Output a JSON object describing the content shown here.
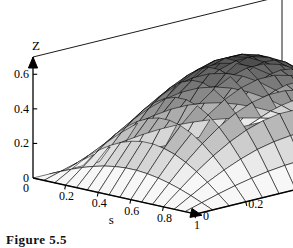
{
  "figure": {
    "caption": "Figure 5.5",
    "kind": "3d-surface-plot",
    "background_color": "#ffffff",
    "line_color": "#000000"
  },
  "axes": {
    "z": {
      "title": "Z",
      "ticks": [
        "0.6",
        "0.4",
        "0.2",
        "0"
      ],
      "tick_values": [
        0.6,
        0.4,
        0.2,
        0
      ],
      "range": [
        0,
        0.7
      ]
    },
    "s": {
      "title": "s",
      "ticks": [
        "0",
        "0.2",
        "0.4",
        "0.6",
        "0.8",
        "1"
      ],
      "tick_values": [
        0,
        0.2,
        0.4,
        0.6,
        0.8,
        1
      ],
      "range": [
        0,
        1
      ]
    },
    "t": {
      "title": "t",
      "ticks": [
        "0",
        "0.2",
        "0.4",
        "0.6",
        "0.8",
        "1"
      ],
      "tick_values": [
        0,
        0.2,
        0.4,
        0.6,
        0.8,
        1
      ],
      "range": [
        0,
        1
      ]
    }
  },
  "chart_data": {
    "type": "surface",
    "title": "",
    "subtitle": "",
    "xlabel": "s",
    "ylabel": "t",
    "zlabel": "Z",
    "xlim": [
      0,
      1
    ],
    "ylim": [
      0,
      1
    ],
    "zlim": [
      0,
      0.7
    ],
    "grid": true,
    "legend": "none",
    "mesh_nx": 16,
    "mesh_ny": 16,
    "surface_shading": "grayscale-dither",
    "surface_min": 0.0,
    "surface_max": 0.64,
    "x": [
      0,
      0.0667,
      0.1333,
      0.2,
      0.2667,
      0.3333,
      0.4,
      0.4667,
      0.5333,
      0.6,
      0.6667,
      0.7333,
      0.8,
      0.8667,
      0.9333,
      1
    ],
    "y": [
      0,
      0.0667,
      0.1333,
      0.2,
      0.2667,
      0.3333,
      0.4,
      0.4667,
      0.5333,
      0.6,
      0.6667,
      0.7333,
      0.8,
      0.8667,
      0.9333,
      1
    ],
    "z_formula": "0.64 * sin(pi*s) * sin(pi*t)",
    "z": [
      [
        0.0,
        0.0,
        0.0,
        0.0,
        0.0,
        0.0,
        0.0,
        0.0,
        0.0,
        0.0,
        0.0,
        0.0,
        0.0,
        0.0,
        0.0,
        0.0
      ],
      [
        0.0,
        0.028,
        0.055,
        0.079,
        0.099,
        0.115,
        0.126,
        0.132,
        0.132,
        0.126,
        0.115,
        0.099,
        0.079,
        0.055,
        0.028,
        0.0
      ],
      [
        0.0,
        0.055,
        0.109,
        0.156,
        0.196,
        0.228,
        0.249,
        0.261,
        0.261,
        0.249,
        0.228,
        0.196,
        0.156,
        0.109,
        0.055,
        0.0
      ],
      [
        0.0,
        0.079,
        0.156,
        0.224,
        0.281,
        0.326,
        0.357,
        0.374,
        0.374,
        0.357,
        0.326,
        0.281,
        0.224,
        0.156,
        0.079,
        0.0
      ],
      [
        0.0,
        0.099,
        0.196,
        0.281,
        0.353,
        0.41,
        0.449,
        0.47,
        0.47,
        0.449,
        0.41,
        0.353,
        0.281,
        0.196,
        0.099,
        0.0
      ],
      [
        0.0,
        0.115,
        0.228,
        0.326,
        0.41,
        0.475,
        0.52,
        0.545,
        0.545,
        0.52,
        0.475,
        0.41,
        0.326,
        0.228,
        0.115,
        0.0
      ],
      [
        0.0,
        0.126,
        0.249,
        0.357,
        0.449,
        0.52,
        0.57,
        0.597,
        0.597,
        0.57,
        0.52,
        0.449,
        0.357,
        0.249,
        0.126,
        0.0
      ],
      [
        0.0,
        0.132,
        0.261,
        0.374,
        0.47,
        0.545,
        0.597,
        0.625,
        0.625,
        0.597,
        0.545,
        0.47,
        0.374,
        0.261,
        0.132,
        0.0
      ],
      [
        0.0,
        0.132,
        0.261,
        0.374,
        0.47,
        0.545,
        0.597,
        0.625,
        0.625,
        0.597,
        0.545,
        0.47,
        0.374,
        0.261,
        0.132,
        0.0
      ],
      [
        0.0,
        0.126,
        0.249,
        0.357,
        0.449,
        0.52,
        0.57,
        0.597,
        0.597,
        0.57,
        0.52,
        0.449,
        0.357,
        0.249,
        0.126,
        0.0
      ],
      [
        0.0,
        0.115,
        0.228,
        0.326,
        0.41,
        0.475,
        0.52,
        0.545,
        0.545,
        0.52,
        0.475,
        0.41,
        0.326,
        0.228,
        0.115,
        0.0
      ],
      [
        0.0,
        0.099,
        0.196,
        0.281,
        0.353,
        0.41,
        0.449,
        0.47,
        0.47,
        0.449,
        0.41,
        0.353,
        0.281,
        0.196,
        0.099,
        0.0
      ],
      [
        0.0,
        0.079,
        0.156,
        0.224,
        0.281,
        0.326,
        0.357,
        0.374,
        0.374,
        0.357,
        0.326,
        0.281,
        0.224,
        0.156,
        0.079,
        0.0
      ],
      [
        0.0,
        0.055,
        0.109,
        0.156,
        0.196,
        0.228,
        0.249,
        0.261,
        0.261,
        0.249,
        0.228,
        0.196,
        0.156,
        0.109,
        0.055,
        0.0
      ],
      [
        0.0,
        0.028,
        0.055,
        0.079,
        0.099,
        0.115,
        0.126,
        0.132,
        0.132,
        0.126,
        0.115,
        0.099,
        0.079,
        0.055,
        0.028,
        0.0
      ],
      [
        0.0,
        0.0,
        0.0,
        0.0,
        0.0,
        0.0,
        0.0,
        0.0,
        0.0,
        0.0,
        0.0,
        0.0,
        0.0,
        0.0,
        0.0,
        0.0
      ]
    ]
  }
}
